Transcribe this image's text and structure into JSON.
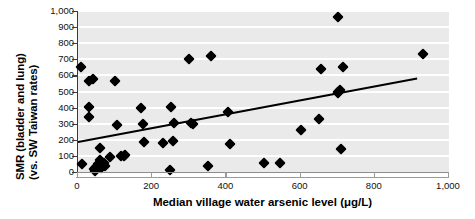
{
  "chart_data": {
    "type": "scatter",
    "title": "",
    "xlabel": "Median village water arsenic level (μg/L)",
    "ylabel": "SMR (bladder and lung) (vs. SW Taiwan rates)",
    "ylabel_lines": [
      "SMR (bladder and lung)",
      "(vs. SW Taiwan rates)"
    ],
    "xlim": [
      0,
      1000
    ],
    "ylim": [
      0,
      1000
    ],
    "xticks": [
      0,
      200,
      400,
      600,
      800,
      1000
    ],
    "xtick_labels": [
      "0",
      "200",
      "400",
      "600",
      "800",
      "1,000"
    ],
    "yticks": [
      0,
      100,
      200,
      300,
      400,
      500,
      600,
      700,
      800,
      900,
      1000
    ],
    "ytick_labels": [
      "0",
      "100",
      "200",
      "300",
      "400",
      "500",
      "600",
      "700",
      "800",
      "900",
      "1,000"
    ],
    "grid": "horizontal-white-on-gray",
    "legend": "none",
    "plot_background": "#eaeaea",
    "gridline_color": "#ffffff",
    "marker": "filled-diamond",
    "marker_color": "#000000",
    "trendline": {
      "color": "#000000",
      "x_start": 0,
      "y_start": 195,
      "x_end": 915,
      "y_end": 590
    },
    "points": [
      {
        "x": 8,
        "y": 655
      },
      {
        "x": 10,
        "y": 48
      },
      {
        "x": 30,
        "y": 565
      },
      {
        "x": 30,
        "y": 405
      },
      {
        "x": 30,
        "y": 340
      },
      {
        "x": 40,
        "y": 578
      },
      {
        "x": 42,
        "y": 18
      },
      {
        "x": 45,
        "y": 8
      },
      {
        "x": 48,
        "y": 30
      },
      {
        "x": 55,
        "y": 50
      },
      {
        "x": 58,
        "y": 148
      },
      {
        "x": 60,
        "y": 72
      },
      {
        "x": 62,
        "y": 22
      },
      {
        "x": 70,
        "y": 58
      },
      {
        "x": 72,
        "y": 40
      },
      {
        "x": 85,
        "y": 95
      },
      {
        "x": 100,
        "y": 565
      },
      {
        "x": 105,
        "y": 290
      },
      {
        "x": 115,
        "y": 98
      },
      {
        "x": 125,
        "y": 102
      },
      {
        "x": 128,
        "y": 105
      },
      {
        "x": 170,
        "y": 395
      },
      {
        "x": 175,
        "y": 300
      },
      {
        "x": 178,
        "y": 188
      },
      {
        "x": 230,
        "y": 178
      },
      {
        "x": 248,
        "y": 10
      },
      {
        "x": 252,
        "y": 405
      },
      {
        "x": 255,
        "y": 190
      },
      {
        "x": 258,
        "y": 305
      },
      {
        "x": 300,
        "y": 700
      },
      {
        "x": 305,
        "y": 305
      },
      {
        "x": 310,
        "y": 298
      },
      {
        "x": 350,
        "y": 38
      },
      {
        "x": 358,
        "y": 720
      },
      {
        "x": 405,
        "y": 372
      },
      {
        "x": 410,
        "y": 172
      },
      {
        "x": 500,
        "y": 58
      },
      {
        "x": 545,
        "y": 55
      },
      {
        "x": 600,
        "y": 260
      },
      {
        "x": 650,
        "y": 330
      },
      {
        "x": 655,
        "y": 640
      },
      {
        "x": 700,
        "y": 960
      },
      {
        "x": 700,
        "y": 500
      },
      {
        "x": 702,
        "y": 490
      },
      {
        "x": 705,
        "y": 510
      },
      {
        "x": 710,
        "y": 140
      },
      {
        "x": 715,
        "y": 655
      },
      {
        "x": 930,
        "y": 730
      }
    ]
  }
}
